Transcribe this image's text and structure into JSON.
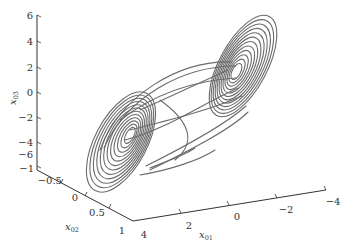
{
  "chart_data": {
    "type": "line",
    "subtype": "3d-trajectory",
    "title": "",
    "axes": {
      "x": {
        "label": "x01",
        "label_main": "x",
        "label_sub": "01",
        "ticks": [
          4,
          2,
          0,
          -2,
          -4
        ],
        "range": [
          4,
          -4
        ]
      },
      "y": {
        "label": "x02",
        "label_main": "x",
        "label_sub": "02",
        "ticks": [
          -1,
          -0.5,
          0,
          0.5,
          1
        ],
        "range": [
          -1,
          1
        ]
      },
      "z": {
        "label": "x03",
        "label_main": "x",
        "label_sub": "03",
        "ticks": [
          6,
          4,
          2,
          0,
          -2,
          -4,
          -6
        ],
        "range": [
          -6,
          6
        ]
      }
    },
    "tick_labels": {
      "z": [
        "6",
        "4",
        "2",
        "0",
        "−2",
        "−4",
        "−6"
      ],
      "y": [
        "−1",
        "−0.5",
        "0",
        "0.5",
        "1"
      ],
      "x": [
        "4",
        "2",
        "0",
        "−2",
        "−4"
      ]
    },
    "series": [
      {
        "name": "trajectory",
        "color": "#6b6b6b",
        "lobes": [
          {
            "name": "left-lobe",
            "approx_center": {
              "x01": 2,
              "x02": 0.5,
              "x03": -4
            }
          },
          {
            "name": "right-lobe",
            "approx_center": {
              "x01": -2,
              "x02": -0.5,
              "x03": 2
            }
          }
        ]
      }
    ],
    "grid": false,
    "legend": null
  }
}
